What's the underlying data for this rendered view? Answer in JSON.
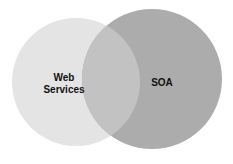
{
  "diagram": {
    "type": "venn",
    "sets": [
      {
        "label_line1": "Web",
        "label_line2": "Services",
        "color": "#e4e4e4"
      },
      {
        "label": "SOA",
        "color": "#acacac"
      }
    ],
    "intersection_color": "#c2c2c2"
  }
}
